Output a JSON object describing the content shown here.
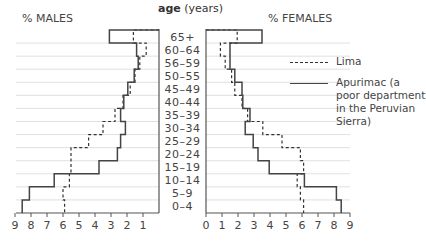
{
  "chart_data": {
    "type": "bar",
    "subtype": "population-pyramid",
    "title": "",
    "center_axis_label": {
      "bold": "age",
      "rest": " (years)"
    },
    "left_label": "% MALES",
    "right_label": "% FEMALES",
    "categories": [
      "65+",
      "60-64",
      "56-59",
      "50-55",
      "45-49",
      "40-44",
      "35-39",
      "30-34",
      "25-29",
      "20-24",
      "15-19",
      "10-14",
      "5-9",
      "0-4"
    ],
    "males_xticks": [
      "9",
      "8",
      "7",
      "6",
      "5",
      "4",
      "3",
      "2",
      "1"
    ],
    "females_xticks": [
      "0",
      "1",
      "2",
      "3",
      "4",
      "5",
      "6",
      "7",
      "8",
      "9"
    ],
    "xlim": [
      0,
      9
    ],
    "series": [
      {
        "name": "Lima",
        "style": "dashed",
        "males": [
          1.6,
          0.8,
          1.2,
          1.5,
          1.8,
          2.25,
          2.75,
          3.5,
          4.4,
          5.5,
          5.5,
          5.6,
          6.0,
          5.9
        ],
        "females": [
          1.95,
          0.9,
          1.2,
          1.6,
          1.8,
          2.25,
          2.6,
          3.55,
          4.75,
          5.9,
          6.1,
          5.7,
          5.9,
          6.1
        ]
      },
      {
        "name": "Apurimac (a poor department in the Peruvian Sierra)",
        "style": "solid",
        "males": [
          3.1,
          1.4,
          1.3,
          1.55,
          1.95,
          2.2,
          2.4,
          2.1,
          2.4,
          2.6,
          3.75,
          6.55,
          8.1,
          8.55
        ],
        "females": [
          3.5,
          1.5,
          1.5,
          1.8,
          2.25,
          2.3,
          2.75,
          2.45,
          2.95,
          3.25,
          3.95,
          6.15,
          8.15,
          8.45
        ]
      }
    ],
    "grid": "horizontal lines per age group",
    "legend_position": "right"
  },
  "legend": {
    "items": [
      {
        "label": "Lima",
        "style": "dashed"
      },
      {
        "label": "Apurimac (a poor department in the Peruvian Sierra)",
        "style": "solid"
      }
    ]
  },
  "colors": {
    "solid": "#444444",
    "dashed": "#333333",
    "grid": "#d8d8d8",
    "axis": "#555555"
  }
}
